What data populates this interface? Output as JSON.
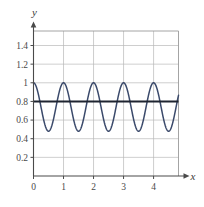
{
  "figure": {
    "background_color": "#ffffff",
    "grid_color": "#b9b9b9",
    "axis_color": "#4a4a4a"
  },
  "axes": {
    "x_axis_label": "x",
    "y_axis_label": "y"
  },
  "chart_data": {
    "type": "line",
    "title": "",
    "xlabel": "x",
    "ylabel": "y",
    "xlim": [
      0,
      4.83
    ],
    "ylim": [
      0,
      1.55
    ],
    "grid": true,
    "legend": "none",
    "xticks": [
      0,
      1,
      2,
      3,
      4
    ],
    "xticklabels": [
      "0",
      "1",
      "2",
      "3",
      "4"
    ],
    "yticks": [
      0.2,
      0.4,
      0.6,
      0.8,
      1,
      1.2,
      1.4
    ],
    "yticklabels": [
      "0.2",
      "0.4",
      "0.6",
      "0.8",
      "1",
      "1.2",
      "1.4"
    ],
    "series": [
      {
        "name": "oscillating-curve",
        "type": "line",
        "color": "#3b4a6b",
        "description": "cosine wave, amplitude 0.26, midline 0.74, period 1",
        "amplitude": 0.26,
        "midline": 0.74,
        "period": 1,
        "phase": 0,
        "y_max": 1.0,
        "y_min": 0.48,
        "peaks_x": [
          0,
          1,
          2,
          3,
          4
        ],
        "troughs_x": [
          0.5,
          1.5,
          2.5,
          3.5,
          4.5
        ]
      },
      {
        "name": "horizontal-line",
        "type": "line",
        "color": "#1e2430",
        "description": "constant horizontal line",
        "constant_y": 0.8
      }
    ]
  }
}
